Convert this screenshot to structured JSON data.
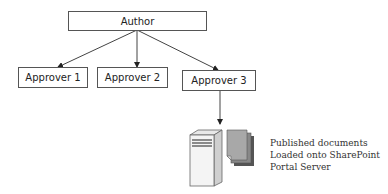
{
  "diagram": {
    "root": {
      "label": "Author"
    },
    "approvers": [
      {
        "label": "Approver 1"
      },
      {
        "label": "Approver 2"
      },
      {
        "label": "Approver 3"
      }
    ],
    "destination": {
      "icons": [
        "server-icon",
        "documents-icon"
      ],
      "caption_lines": [
        "Published documents",
        "Loaded onto SharePoint",
        "Portal Server"
      ]
    },
    "edges": [
      {
        "from": "Author",
        "to": "Approver 1"
      },
      {
        "from": "Author",
        "to": "Approver 2"
      },
      {
        "from": "Author",
        "to": "Approver 3"
      },
      {
        "from": "Approver 3",
        "to": "Server"
      }
    ]
  }
}
